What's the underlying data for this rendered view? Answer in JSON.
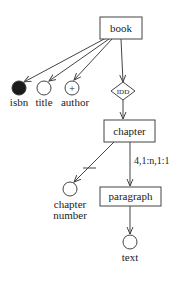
{
  "diagram": {
    "nodes": {
      "book": {
        "label": "book",
        "shape": "rectangle"
      },
      "isbn": {
        "label": "isbn",
        "shape": "filled-circle"
      },
      "title": {
        "label": "title",
        "shape": "circle"
      },
      "author": {
        "label": "author",
        "shape": "circle-plus",
        "symbol": "+"
      },
      "idd": {
        "label": "IDD",
        "shape": "diamond"
      },
      "chapter": {
        "label": "chapter",
        "shape": "rectangle"
      },
      "chapter_number": {
        "label_line1": "chapter",
        "label_line2": "number",
        "shape": "circle"
      },
      "paragraph": {
        "label": "paragraph",
        "shape": "rectangle"
      },
      "text": {
        "label": "text",
        "shape": "circle"
      }
    },
    "edges": [
      {
        "from": "book",
        "to": "isbn"
      },
      {
        "from": "book",
        "to": "title"
      },
      {
        "from": "book",
        "to": "author"
      },
      {
        "from": "book",
        "to": "idd"
      },
      {
        "from": "idd",
        "to": "chapter"
      },
      {
        "from": "chapter",
        "to": "chapter_number",
        "marker": "crossbar"
      },
      {
        "from": "chapter",
        "to": "paragraph",
        "label": "4,1:n,1:1"
      },
      {
        "from": "paragraph",
        "to": "text"
      }
    ],
    "edge_labels": {
      "chapter_paragraph": "4,1:n,1:1"
    },
    "colors": {
      "stroke": "#444444",
      "fill_dark": "#1a1a1a",
      "background": "#ffffff"
    }
  }
}
